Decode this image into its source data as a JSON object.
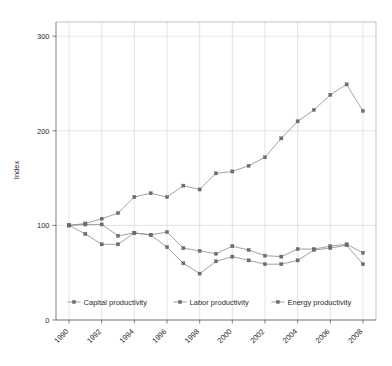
{
  "chart_data": {
    "type": "line",
    "title": "",
    "xlabel": "",
    "ylabel": "Index",
    "xlim": [
      1989.2,
      2008.8
    ],
    "ylim": [
      0,
      315
    ],
    "yticks": [
      0,
      100,
      200,
      300
    ],
    "ytick_labels": [
      "0",
      "100",
      "200",
      "300"
    ],
    "xticks": [
      1990,
      1992,
      1994,
      1996,
      1998,
      2000,
      2002,
      2004,
      2006,
      2008
    ],
    "xtick_labels": [
      "1990",
      "1992",
      "1994",
      "1996",
      "1998",
      "2000",
      "2002",
      "2004",
      "2006",
      "2008"
    ],
    "x": [
      1990,
      1991,
      1992,
      1993,
      1994,
      1995,
      1996,
      1997,
      1998,
      1999,
      2000,
      2001,
      2002,
      2003,
      2004,
      2005,
      2006,
      2007,
      2008
    ],
    "grid": true,
    "grid_axis": "both",
    "legend_position": "inside-bottom-center",
    "marker": "square",
    "line_color": "#7a7a7a",
    "marker_color": "#6e6e6e",
    "series": [
      {
        "name": "Capital productivity",
        "values": [
          100,
          101,
          101,
          89,
          92,
          90,
          93,
          76,
          73,
          70,
          78,
          74,
          68,
          67,
          75,
          75,
          78,
          80,
          71
        ]
      },
      {
        "name": "Labor productivity",
        "values": [
          100,
          91,
          80,
          80,
          92,
          90,
          77,
          60,
          49,
          62,
          67,
          63,
          59,
          59,
          63,
          74,
          76,
          79,
          59
        ]
      },
      {
        "name": "Energy productivity",
        "values": [
          100,
          102,
          107,
          113,
          130,
          134,
          130,
          142,
          138,
          155,
          157,
          163,
          172,
          192,
          210,
          222,
          238,
          249,
          221
        ]
      }
    ]
  },
  "legend": {
    "entries": [
      {
        "label": "Capital productivity"
      },
      {
        "label": "Labor productivity"
      },
      {
        "label": "Energy productivity"
      }
    ]
  }
}
